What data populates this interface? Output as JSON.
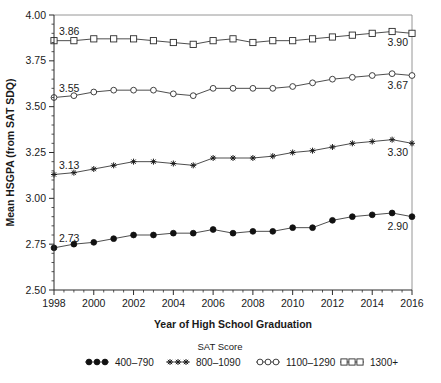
{
  "chart_data": {
    "type": "line",
    "title": "",
    "xlabel": "Year of High School Graduation",
    "ylabel": "Mean HSGPA (from SAT SDQ)",
    "xlim": [
      1998,
      2016
    ],
    "ylim": [
      2.5,
      4.0
    ],
    "ytick_labels": [
      "2.50",
      "2.75",
      "3.00",
      "3.25",
      "3.50",
      "3.75",
      "4.00"
    ],
    "ytick_values": [
      2.5,
      2.75,
      3.0,
      3.25,
      3.5,
      3.75,
      4.0
    ],
    "xtick_labels": [
      "1998",
      "2000",
      "2002",
      "2004",
      "2006",
      "2008",
      "2010",
      "2012",
      "2014",
      "2016"
    ],
    "xtick_values": [
      1998,
      2000,
      2002,
      2004,
      2006,
      2008,
      2010,
      2012,
      2014,
      2016
    ],
    "grid": false,
    "legend_position": "bottom",
    "legend_title": "SAT Score",
    "x": [
      1998,
      1999,
      2000,
      2001,
      2002,
      2003,
      2004,
      2005,
      2006,
      2007,
      2008,
      2009,
      2010,
      2011,
      2012,
      2013,
      2014,
      2015,
      2016
    ],
    "series": [
      {
        "name": "400–790",
        "marker": "filled-circle",
        "values": [
          2.73,
          2.75,
          2.76,
          2.78,
          2.8,
          2.8,
          2.81,
          2.81,
          2.83,
          2.81,
          2.82,
          2.82,
          2.84,
          2.84,
          2.88,
          2.9,
          2.91,
          2.92,
          2.9
        ],
        "start_label": "2.73",
        "end_label": "2.90"
      },
      {
        "name": "800–1090",
        "marker": "plus",
        "values": [
          3.13,
          3.14,
          3.16,
          3.18,
          3.2,
          3.2,
          3.19,
          3.18,
          3.22,
          3.22,
          3.22,
          3.23,
          3.25,
          3.26,
          3.28,
          3.3,
          3.31,
          3.32,
          3.3
        ],
        "start_label": "3.13",
        "end_label": "3.30"
      },
      {
        "name": "1100–1290",
        "marker": "open-circle",
        "values": [
          3.55,
          3.56,
          3.58,
          3.59,
          3.59,
          3.59,
          3.57,
          3.56,
          3.6,
          3.6,
          3.6,
          3.6,
          3.61,
          3.63,
          3.65,
          3.66,
          3.67,
          3.68,
          3.67
        ],
        "start_label": "3.55",
        "end_label": "3.67"
      },
      {
        "name": "1300+",
        "marker": "open-square",
        "values": [
          3.86,
          3.86,
          3.87,
          3.87,
          3.87,
          3.86,
          3.85,
          3.84,
          3.86,
          3.87,
          3.85,
          3.86,
          3.86,
          3.87,
          3.88,
          3.89,
          3.9,
          3.91,
          3.9
        ],
        "start_label": "3.86",
        "end_label": "3.90"
      }
    ],
    "annotations": [
      {
        "text": "3.86",
        "series": "1300+",
        "at": "start"
      },
      {
        "text": "3.90",
        "series": "1300+",
        "at": "end"
      },
      {
        "text": "3.55",
        "series": "1100–1290",
        "at": "start"
      },
      {
        "text": "3.67",
        "series": "1100–1290",
        "at": "end"
      },
      {
        "text": "3.13",
        "series": "800–1090",
        "at": "start"
      },
      {
        "text": "3.30",
        "series": "800–1090",
        "at": "end"
      },
      {
        "text": "2.73",
        "series": "400–790",
        "at": "start"
      },
      {
        "text": "2.90",
        "series": "400–790",
        "at": "end"
      }
    ],
    "colors": {
      "line": "#3a3a3a",
      "text": "#1a1a1a",
      "axis": "#2b2b2b",
      "border": "#8a8a8a"
    }
  },
  "legend": {
    "title": "SAT Score",
    "items": [
      {
        "label": "400–790",
        "marker": "filled-circle"
      },
      {
        "label": "800–1090",
        "marker": "plus"
      },
      {
        "label": "1100–1290",
        "marker": "open-circle"
      },
      {
        "label": "1300+",
        "marker": "open-square"
      }
    ]
  },
  "axes": {
    "x_title": "Year of High School Graduation",
    "y_title": "Mean HSGPA (from SAT SDQ)"
  }
}
